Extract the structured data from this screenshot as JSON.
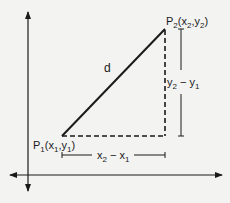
{
  "diagram": {
    "colors": {
      "background": "#f3f3f2",
      "ink": "#1a1a1a"
    },
    "labels": {
      "distance": "d",
      "p1": {
        "name": "P",
        "sub": "1",
        "coords_open": "(x",
        "coords_sub1": "1",
        "coords_mid": ",y",
        "coords_sub2": "1",
        "coords_close": ")"
      },
      "p2": {
        "name": "P",
        "sub": "2",
        "coords_open": "(x",
        "coords_sub1": "2",
        "coords_mid": ",y",
        "coords_sub2": "2",
        "coords_close": ")"
      },
      "dy": {
        "a": "y",
        "a_sub": "2",
        "op": " − ",
        "b": "y",
        "b_sub": "1"
      },
      "dx": {
        "a": "x",
        "a_sub": "2",
        "op": " − ",
        "b": "x",
        "b_sub": "1"
      }
    },
    "points": {
      "P1": [
        62,
        136
      ],
      "P2": [
        165,
        29
      ]
    }
  }
}
